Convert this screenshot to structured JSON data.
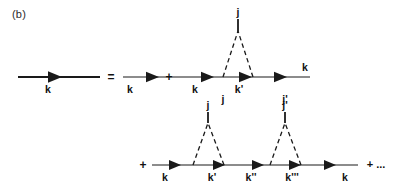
{
  "figure": {
    "panel_label": "(b)",
    "type": "feynman-dyson-series"
  },
  "colors": {
    "line": "#1a1a1a",
    "dashed": "#1a1a1a",
    "text": "#111111",
    "background": "#ffffff"
  },
  "operators": {
    "equals": "=",
    "plus_row1": "+",
    "plus_row2": "+",
    "plus_ellipsis": "+ ..."
  },
  "row1": {
    "lhs": {
      "momentum_label": "k"
    },
    "term1": {
      "momentum_label": "k"
    },
    "term2": {
      "momentum_in": "k",
      "momentum_mid": "k'",
      "momentum_out": "k",
      "vertex_left_index": "j",
      "vertex_right_index": "j'",
      "apex_index": "j"
    }
  },
  "row2": {
    "term": {
      "momentum_1": "k",
      "momentum_2": "k'",
      "momentum_3": "k''",
      "momentum_4": "k'''",
      "momentum_5": "k",
      "apex_index_1": "j",
      "apex_index_2": "j'"
    }
  }
}
